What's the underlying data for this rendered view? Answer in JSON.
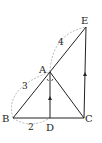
{
  "diagram": {
    "points": {
      "E": {
        "label": "E",
        "x": 86,
        "y": 27
      },
      "A": {
        "label": "A",
        "x": 50,
        "y": 72
      },
      "B": {
        "label": "B",
        "x": 13,
        "y": 118
      },
      "D": {
        "label": "D",
        "x": 50,
        "y": 118
      },
      "C": {
        "label": "C",
        "x": 84,
        "y": 118
      }
    },
    "segments": [
      "BE",
      "AC",
      "BC",
      "AD",
      "EC"
    ],
    "parallel_marks": [
      "AD",
      "EC"
    ],
    "equal_angle_marks": [
      "BAD",
      "DAC"
    ],
    "measurements": {
      "AB": "3",
      "AE": "4",
      "BD": "2"
    },
    "colors": {
      "line": "#222222",
      "dashed": "#999999"
    }
  }
}
